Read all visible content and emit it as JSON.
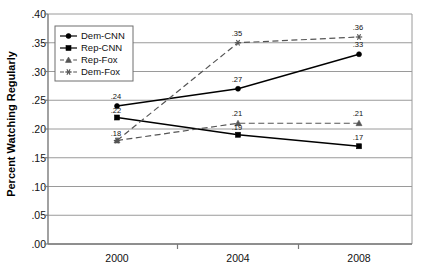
{
  "chart_data": {
    "type": "line",
    "title": "",
    "xlabel": "",
    "ylabel": "Percent Watching Regularly",
    "categories": [
      "2000",
      "2004",
      "2008"
    ],
    "x": [
      2000,
      2004,
      2008
    ],
    "ylim": [
      0.0,
      0.4
    ],
    "ytick_labels": [
      ".00",
      ".05",
      ".10",
      ".15",
      ".20",
      ".25",
      ".30",
      ".35",
      ".40"
    ],
    "ytick_values": [
      0.0,
      0.05,
      0.1,
      0.15,
      0.2,
      0.25,
      0.3,
      0.35,
      0.4
    ],
    "grid": "horizontal",
    "legend_position": "upper-left-inside",
    "series": [
      {
        "name": "Dem-CNN",
        "style": "solid",
        "marker": "circle",
        "color": "#000000",
        "values": [
          0.24,
          0.27,
          0.33
        ],
        "data_labels": [
          ".24",
          ".27",
          ".33"
        ]
      },
      {
        "name": "Rep-CNN",
        "style": "solid",
        "marker": "square",
        "color": "#000000",
        "values": [
          0.22,
          0.19,
          0.17
        ],
        "data_labels": [
          ".22",
          ".19",
          ".17"
        ]
      },
      {
        "name": "Rep-Fox",
        "style": "dashed",
        "marker": "triangle",
        "color": "#555555",
        "values": [
          0.18,
          0.21,
          0.21
        ],
        "data_labels": [
          ".18",
          ".21",
          ".21"
        ]
      },
      {
        "name": "Dem-Fox",
        "style": "dashed",
        "marker": "asterisk",
        "color": "#555555",
        "values": [
          0.18,
          0.35,
          0.36
        ],
        "data_labels": [
          "",
          ".35",
          ".36"
        ]
      }
    ]
  }
}
